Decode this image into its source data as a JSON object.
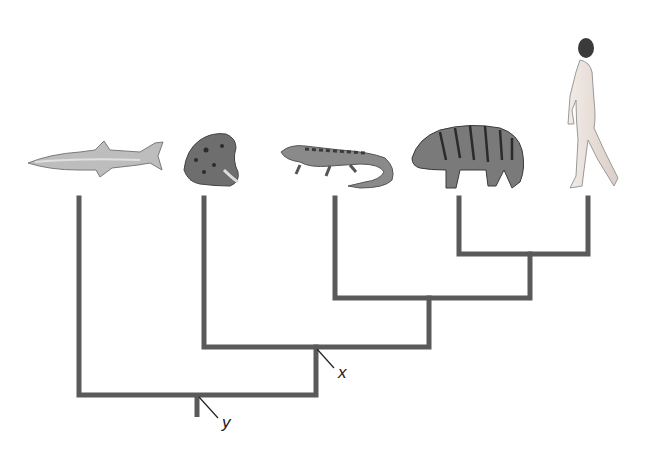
{
  "diagram": {
    "type": "cladogram",
    "taxa": [
      {
        "name": "shark",
        "icon": "shark-icon"
      },
      {
        "name": "frog",
        "icon": "frog-icon"
      },
      {
        "name": "lizard",
        "icon": "lizard-icon"
      },
      {
        "name": "tiger",
        "icon": "tiger-icon"
      },
      {
        "name": "human",
        "icon": "human-icon"
      }
    ],
    "nodes": [
      {
        "label": "x",
        "position": "common ancestor of frog, lizard, tiger, human"
      },
      {
        "label": "y",
        "position": "root (common ancestor of all five)"
      }
    ],
    "line_color": "#5a5a5a"
  }
}
